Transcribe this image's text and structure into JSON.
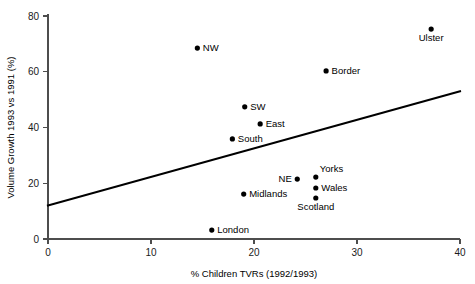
{
  "chart_data": {
    "type": "scatter",
    "title": "",
    "xlabel": "% Children TVRs (1992/1993)",
    "ylabel": "Volume Growth 1993 vs 1991 (%)",
    "xlim": [
      0,
      40
    ],
    "ylim": [
      0,
      80
    ],
    "xticks": [
      0,
      10,
      20,
      30,
      40
    ],
    "yticks": [
      0,
      20,
      40,
      60,
      80
    ],
    "xticklabels": [
      "0",
      "10",
      "20",
      "30",
      "40"
    ],
    "yticklabels": [
      "0",
      "20",
      "40",
      "60",
      "80"
    ],
    "grid": false,
    "legend": false,
    "points": [
      {
        "label": "NW",
        "x": 14.5,
        "y": 68.5,
        "label_pos": "right"
      },
      {
        "label": "Ulster",
        "x": 37.2,
        "y": 75.3,
        "label_pos": "below"
      },
      {
        "label": "Border",
        "x": 27.0,
        "y": 60.3,
        "label_pos": "right"
      },
      {
        "label": "SW",
        "x": 19.1,
        "y": 47.4,
        "label_pos": "right"
      },
      {
        "label": "East",
        "x": 20.6,
        "y": 41.3,
        "label_pos": "right"
      },
      {
        "label": "South",
        "x": 17.9,
        "y": 35.9,
        "label_pos": "right"
      },
      {
        "label": "Yorks",
        "x": 26.0,
        "y": 22.2,
        "label_pos": "above-right"
      },
      {
        "label": "NE",
        "x": 24.2,
        "y": 21.5,
        "label_pos": "left"
      },
      {
        "label": "Wales",
        "x": 26.0,
        "y": 18.3,
        "label_pos": "right"
      },
      {
        "label": "Scotland",
        "x": 26.0,
        "y": 14.7,
        "label_pos": "below"
      },
      {
        "label": "Midlands",
        "x": 19.0,
        "y": 16.1,
        "label_pos": "right"
      },
      {
        "label": "London",
        "x": 15.9,
        "y": 3.2,
        "label_pos": "right"
      }
    ],
    "trendline": {
      "x0": 0,
      "y0": 12.0,
      "x1": 40,
      "y1": 53.0
    }
  },
  "colors": {
    "background": "#ffffff",
    "axis": "#4d4d4d",
    "point": "#000000",
    "trend": "#000000",
    "text": "#000000"
  }
}
